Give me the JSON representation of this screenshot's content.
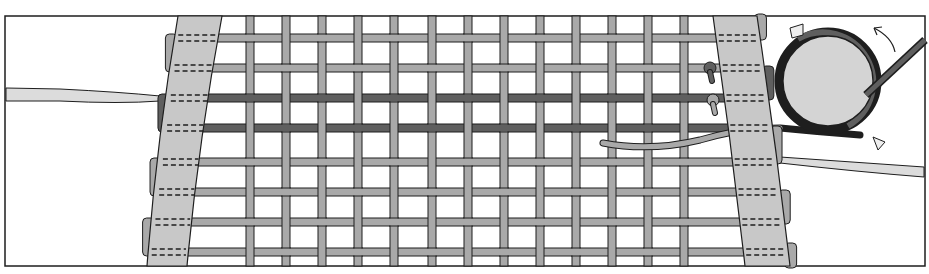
{
  "figure": {
    "title": "",
    "colors": {
      "background": "#ffffff",
      "outline": "#1e1e1e",
      "strand_light": "#a9a9a9",
      "strand_dark": "#5f5f5f",
      "band_fill": "#c8c8c8",
      "roller_fill": "#d4d4d4",
      "taper_fill": "#dcdcdc"
    },
    "frame": {
      "x": 5,
      "y": 16,
      "width": 920,
      "height": 250
    },
    "weft_rows_y": [
      38,
      68,
      98,
      128,
      162,
      192,
      222,
      252
    ],
    "dark_weft_rows": [
      2,
      3
    ],
    "warp_cols_x": [
      250,
      286,
      322,
      358,
      394,
      432,
      468,
      504,
      540,
      576,
      612,
      648,
      684
    ],
    "left_band": {
      "top_x": [
        178,
        222
      ],
      "bottom_x": [
        147,
        187
      ]
    },
    "right_band": {
      "top_x": [
        713,
        757
      ],
      "bottom_x": [
        745,
        790
      ]
    },
    "roller": {
      "cx": 828,
      "cy": 81,
      "r": 45
    },
    "arrow": {
      "direction": "clockwise",
      "label": ""
    }
  }
}
